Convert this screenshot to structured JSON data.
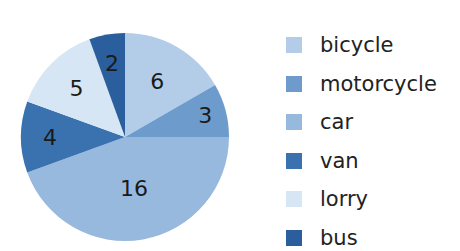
{
  "chart_data": {
    "type": "pie",
    "title": "",
    "categories": [
      "bicycle",
      "motorcycle",
      "car",
      "van",
      "lorry",
      "bus"
    ],
    "values": [
      6,
      3,
      16,
      4,
      5,
      2
    ],
    "colors": [
      "#b3cde8",
      "#6d9ccc",
      "#98b9de",
      "#3a72b0",
      "#d6e6f4",
      "#2a5e9c"
    ],
    "data_labels": [
      "6",
      "3",
      "16",
      "4",
      "5",
      "2"
    ],
    "start_angle": "12 o'clock, clockwise",
    "legend_position": "right"
  },
  "legend": {
    "items": [
      {
        "label": "bicycle",
        "color": "#b3cde8"
      },
      {
        "label": "motorcycle",
        "color": "#6d9ccc"
      },
      {
        "label": "car",
        "color": "#98b9de"
      },
      {
        "label": "van",
        "color": "#3a72b0"
      },
      {
        "label": "lorry",
        "color": "#d6e6f4"
      },
      {
        "label": "bus",
        "color": "#2a5e9c"
      }
    ]
  }
}
